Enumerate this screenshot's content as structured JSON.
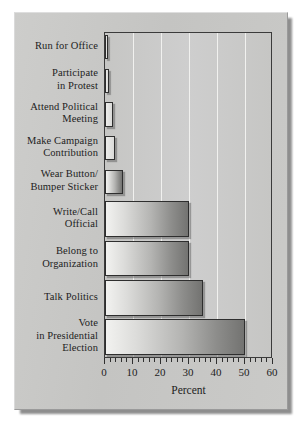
{
  "chart_data": {
    "type": "bar",
    "orientation": "horizontal",
    "title": "",
    "xlabel": "Percent",
    "ylabel": "",
    "xlim": [
      0,
      60
    ],
    "xticks": [
      0,
      10,
      20,
      30,
      40,
      50,
      60
    ],
    "xtick_labels": [
      "0",
      "10",
      "20",
      "30",
      "40",
      "50",
      "60"
    ],
    "minor_tick_step": 2,
    "grid": "vertical-only",
    "legend": "none",
    "categories": [
      "Run for Office",
      "Participate in Protest",
      "Attend Political Meeting",
      "Make Campaign Contribution",
      "Wear Button/ Bumper Sticker",
      "Write/Call Official",
      "Belong to Organization",
      "Talk Politics",
      "Vote in Presidential Election"
    ],
    "category_label_lines": [
      [
        "Run for Office"
      ],
      [
        "Participate",
        "in Protest"
      ],
      [
        "Attend Political",
        "Meeting"
      ],
      [
        "Make Campaign",
        "Contribution"
      ],
      [
        "Wear Button/",
        "Bumper Sticker"
      ],
      [
        "Write/Call",
        "Official"
      ],
      [
        "Belong to",
        "Organization"
      ],
      [
        "Talk Politics"
      ],
      [
        "Vote",
        "in Presidential",
        "Election"
      ]
    ],
    "values": [
      1,
      1.5,
      3,
      3.5,
      6.5,
      30,
      30,
      35,
      50
    ]
  },
  "axis": {
    "title": "Percent"
  },
  "colors": {
    "panel_background": "#c7c7c5",
    "plot_background": "#c9c9c7",
    "gridline": "#f1f1ef",
    "bar_light": "#f2f2f0",
    "bar_dark": "#737371",
    "bar_outline": "#2e2e2e",
    "text": "#1d1d1d"
  }
}
